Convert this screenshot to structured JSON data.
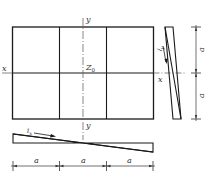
{
  "diagram": {
    "axis_labels": {
      "x_left": "x",
      "x_right": "x",
      "y_top": "y",
      "y_bottom": "y",
      "origin": "Z",
      "origin_sub": "0"
    },
    "slope_labels": {
      "vertical": "i",
      "vertical_sub": "y",
      "horizontal": "i",
      "horizontal_sub": "x"
    },
    "dimensions": {
      "horizontal": [
        "a",
        "a",
        "a"
      ],
      "vertical": [
        "a",
        "a"
      ]
    },
    "colors": {
      "line": "#1a1a1a",
      "axis": "#555555"
    }
  }
}
